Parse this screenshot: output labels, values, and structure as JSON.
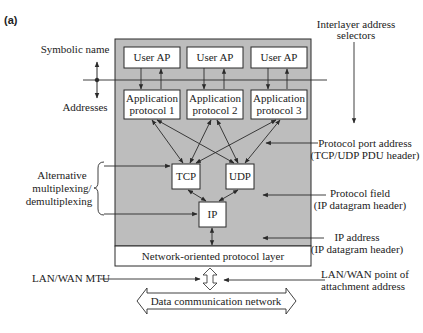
{
  "figure": {
    "panel_label": "(a)"
  },
  "colors": {
    "shaded_region": "#bdbdbd",
    "box_fill": "#ffffff",
    "stroke": "#2a2a2a",
    "text": "#222222"
  },
  "left_labels": {
    "symbolic_name": "Symbolic name",
    "addresses": "Addresses",
    "alternative_line1": "Alternative",
    "alternative_line2": "multiplexing/",
    "alternative_line3": "demultiplexing",
    "lan_wan_mtu": "LAN/WAN MTU"
  },
  "right_labels": {
    "interlayer_line1": "Interlayer address",
    "interlayer_line2": "selectors",
    "port_line1": "Protocol port address",
    "port_line2": "(TCP/UDP PDU header)",
    "protocol_field_line1": "Protocol field",
    "protocol_field_line2": "(IP datagram header)",
    "ip_address_line1": "IP address",
    "ip_address_line2": "(IP datagram header)",
    "attach_line1": "LAN/WAN point of",
    "attach_line2": "attachment address"
  },
  "boxes": {
    "user_ap": [
      "User AP",
      "User AP",
      "User AP"
    ],
    "app_protocol": [
      {
        "line1": "Application",
        "line2": "protocol 1"
      },
      {
        "line1": "Application",
        "line2": "protocol 2"
      },
      {
        "line1": "Application",
        "line2": "protocol 3"
      }
    ],
    "tcp": "TCP",
    "udp": "UDP",
    "ip": "IP",
    "network_layer": "Network-oriented protocol layer",
    "data_network": "Data communication network"
  }
}
